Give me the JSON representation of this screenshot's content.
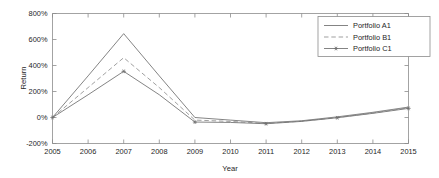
{
  "chart_data": {
    "type": "line",
    "title": "",
    "xlabel": "Year",
    "ylabel": "Return",
    "x": [
      2005,
      2006,
      2007,
      2008,
      2009,
      2010,
      2011,
      2012,
      2013,
      2014,
      2015
    ],
    "xtick_labels": [
      "2005",
      "2006",
      "2007",
      "2008",
      "2009",
      "2010",
      "2011",
      "2012",
      "2013",
      "2014",
      "2015"
    ],
    "ytick_labels": [
      "-200%",
      "0%",
      "200%",
      "400%",
      "600%",
      "800%"
    ],
    "ytick_values": [
      -200,
      0,
      200,
      400,
      600,
      800
    ],
    "xlim": [
      2005,
      2015
    ],
    "ylim": [
      -200,
      800
    ],
    "grid": false,
    "legend_position": "top-right",
    "series": [
      {
        "name": "Portfolio A1",
        "style": "solid",
        "marker": "none",
        "color": "#6e6e6e",
        "values": [
          0,
          320,
          645,
          320,
          0,
          -20,
          -40,
          -25,
          5,
          40,
          80
        ]
      },
      {
        "name": "Portfolio B1",
        "style": "dashed",
        "marker": "none",
        "color": "#8f8f8f",
        "values": [
          0,
          230,
          460,
          230,
          -20,
          -30,
          -45,
          -28,
          0,
          35,
          75
        ]
      },
      {
        "name": "Portfolio C1",
        "style": "solid",
        "marker": "star",
        "color": "#6e6e6e",
        "values": [
          0,
          175,
          355,
          175,
          -35,
          -38,
          -48,
          -30,
          -2,
          32,
          70
        ]
      }
    ]
  },
  "legend": {
    "entries": [
      "Portfolio A1",
      "Portfolio B1",
      "Portfolio C1"
    ]
  },
  "axes": {
    "x_title": "Year",
    "y_title": "Return"
  },
  "colors": {
    "axis": "#8c8c8c",
    "text": "#262626",
    "background": "#ffffff"
  }
}
